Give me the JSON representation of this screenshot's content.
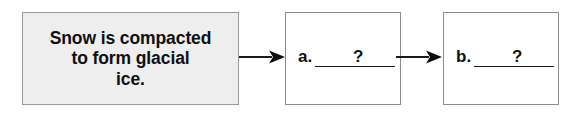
{
  "diagram": {
    "type": "process-flow-chart",
    "orientation": "horizontal-left-to-right",
    "steps": [
      {
        "id": "step-1",
        "kind": "statement",
        "text": "Snow is compacted\nto form glacial\nice.",
        "fill_color": "#eeeeee",
        "border_color": "#999999"
      },
      {
        "id": "step-2",
        "kind": "blank",
        "label": "a.",
        "question_mark": "?",
        "fill_color": "#ffffff",
        "border_color": "#8c8c8c"
      },
      {
        "id": "step-3",
        "kind": "blank",
        "label": "b.",
        "question_mark": "?",
        "fill_color": "#ffffff",
        "border_color": "#8c8c8c"
      }
    ],
    "connectors": [
      {
        "id": "arrow-1",
        "from": "step-1",
        "to": "step-2",
        "icon": "arrow-right-icon",
        "color": "#1a1a1a"
      },
      {
        "id": "arrow-2",
        "from": "step-2",
        "to": "step-3",
        "icon": "arrow-right-icon",
        "color": "#1a1a1a"
      }
    ]
  }
}
